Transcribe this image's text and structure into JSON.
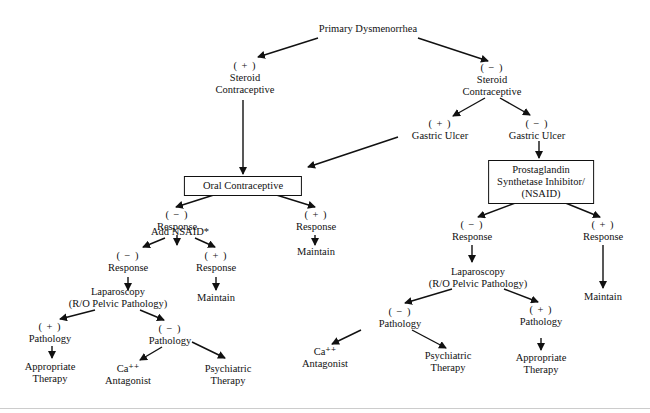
{
  "diagram": {
    "title": "Primary Dysmenorrhea",
    "nodes": {
      "root": {
        "label": "Primary Dysmenorrhea"
      },
      "steroid_pos": {
        "sign": "( + )",
        "line1": "Steroid",
        "line2": "Contraceptive"
      },
      "steroid_neg": {
        "sign": "( − )",
        "line1": "Steroid",
        "line2": "Contraceptive"
      },
      "gastric_pos": {
        "sign": "( + )",
        "label": "Gastric Ulcer"
      },
      "gastric_neg": {
        "sign": "( − )",
        "label": "Gastric Ulcer"
      },
      "oral_contraceptive": {
        "label": "Oral Contraceptive"
      },
      "nsaid_box": {
        "line1": "Prostaglandin",
        "line2": "Synthetase Inhibitor/",
        "line3": "(NSAID)"
      },
      "oc_resp_neg": {
        "sign": "( − )",
        "label": "Response"
      },
      "oc_resp_pos": {
        "sign": "( + )",
        "label": "Response"
      },
      "oc_maintain": {
        "label": "Maintain"
      },
      "add_nsaid": {
        "label": "Add NSAID*"
      },
      "add_resp_neg": {
        "sign": "( − )",
        "label": "Response"
      },
      "add_resp_pos": {
        "sign": "( + )",
        "label": "Response"
      },
      "add_maintain": {
        "label": "Maintain"
      },
      "lap_left": {
        "line1": "Laparoscopy",
        "line2": "(R/O Pelvic Pathology)"
      },
      "left_path_pos": {
        "sign": "( + )",
        "label": "Pathology"
      },
      "left_path_neg": {
        "sign": "( − )",
        "label": "Pathology"
      },
      "left_appropriate": {
        "line1": "Appropriate",
        "line2": "Therapy"
      },
      "left_ca": {
        "line1": "Ca⁺⁺",
        "line2": "Antagonist"
      },
      "left_psych": {
        "line1": "Psychiatric",
        "line2": "Therapy"
      },
      "ns_resp_neg": {
        "sign": "( − )",
        "label": "Response"
      },
      "ns_resp_pos": {
        "sign": "( + )",
        "label": "Response"
      },
      "ns_maintain": {
        "label": "Maintain"
      },
      "lap_right": {
        "line1": "Laparoscopy",
        "line2": "(R/O Pelvic Pathology)"
      },
      "right_path_neg": {
        "sign": "( − )",
        "label": "Pathology"
      },
      "right_path_pos": {
        "sign": "( + )",
        "label": "Pathology"
      },
      "right_ca": {
        "line1": "Ca⁺⁺",
        "line2": "Antagonist"
      },
      "right_psych": {
        "line1": "Psychiatric",
        "line2": "Therapy"
      },
      "right_appropriate": {
        "line1": "Appropriate",
        "line2": "Therapy"
      }
    }
  }
}
